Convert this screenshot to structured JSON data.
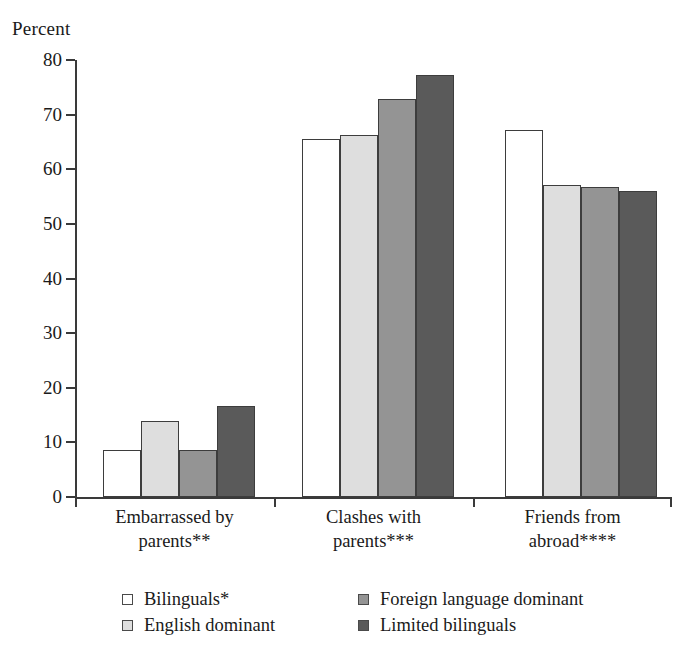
{
  "chart_data": {
    "type": "bar",
    "title": "",
    "ylabel": "Percent",
    "xlabel": "",
    "ylim": [
      0,
      80
    ],
    "yticks": [
      0,
      10,
      20,
      30,
      40,
      50,
      60,
      70,
      80
    ],
    "grid": false,
    "legend_position": "bottom",
    "categories": [
      "Embarrassed by\nparents**",
      "Clashes with\nparents***",
      "Friends from\nabroad****"
    ],
    "series": [
      {
        "name": "Bilinguals*",
        "swatch": "#ffffff",
        "values": [
          8.6,
          65.5,
          67.2
        ]
      },
      {
        "name": "English dominant",
        "swatch": "#dedede",
        "values": [
          14.0,
          66.3,
          57.1
        ]
      },
      {
        "name": "Foreign language dominant",
        "swatch": "#949494",
        "values": [
          8.6,
          72.8,
          56.8
        ]
      },
      {
        "name": "Limited bilinguals",
        "swatch": "#5a5a5a",
        "values": [
          16.7,
          77.2,
          56.0
        ]
      }
    ]
  }
}
